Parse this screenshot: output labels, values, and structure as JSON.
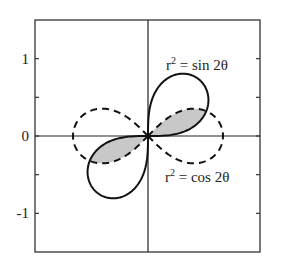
{
  "chart_data": {
    "type": "line",
    "subtype": "polar-curves",
    "title": "",
    "xlabel": "",
    "ylabel": "",
    "xlim": [
      -1.5,
      1.5
    ],
    "ylim": [
      -1.5,
      1.5
    ],
    "grid": false,
    "legend": null,
    "y_ticks": [
      {
        "value": 1,
        "label": "1"
      },
      {
        "value": 0.5,
        "label": ""
      },
      {
        "value": 0,
        "label": "0"
      },
      {
        "value": -0.5,
        "label": ""
      },
      {
        "value": -1,
        "label": "-1"
      }
    ],
    "axes_lines": {
      "x_axis_at": 0,
      "y_axis_at": 0
    },
    "series": [
      {
        "name": "r^2 = sin 2θ",
        "equation": "r^2 = sin(2θ)",
        "style": "solid",
        "color": "#111111",
        "lobes": "quadrants I and III",
        "max_r": 1,
        "max_at_theta_deg": [
          45,
          225
        ]
      },
      {
        "name": "r^2 = cos 2θ",
        "equation": "r^2 = cos(2θ)",
        "style": "dashed",
        "color": "#111111",
        "lobes": "along x-axis (left and right)",
        "max_r": 1,
        "max_at_theta_deg": [
          0,
          180
        ]
      }
    ],
    "shaded_region": {
      "description": "intersection of both lemniscates",
      "color": "#c8c8c8",
      "intersection_theta_deg": [
        22.5,
        202.5
      ],
      "intersection_r": 0.8409
    },
    "annotations": [
      {
        "text_base": "r",
        "text_sup": "2",
        "text_rest": " = sin 2θ",
        "x": 0.25,
        "y": 0.86
      },
      {
        "text_base": "r",
        "text_sup": "2",
        "text_rest": " = cos 2θ",
        "x": 0.24,
        "y": -0.6
      }
    ]
  }
}
